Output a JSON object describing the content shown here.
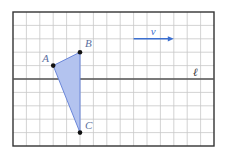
{
  "figure": {
    "grid": {
      "origin_x": 13,
      "origin_y": 12,
      "cell": 13.4,
      "cols": 15,
      "rows": 10,
      "grid_color": "#c8c8c8",
      "border_color": "#333333"
    },
    "line_l": {
      "label": "ℓ",
      "row": 5,
      "color": "#555555"
    },
    "vector_v": {
      "label": "v",
      "from": [
        9,
        2
      ],
      "to": [
        12,
        2
      ],
      "color": "#3b6fd0"
    },
    "triangle": {
      "fill": "#b3c3ef",
      "stroke": "#6a86d9",
      "vertex_color": "#111111",
      "label_color": "#5a6fa0",
      "points": [
        {
          "name": "A",
          "col": 3,
          "row": 4,
          "label_dx": -11,
          "label_dy": -4
        },
        {
          "name": "B",
          "col": 5,
          "row": 3,
          "label_dx": 5,
          "label_dy": -5
        },
        {
          "name": "C",
          "col": 5,
          "row": 9,
          "label_dx": 5,
          "label_dy": -4
        }
      ]
    }
  }
}
